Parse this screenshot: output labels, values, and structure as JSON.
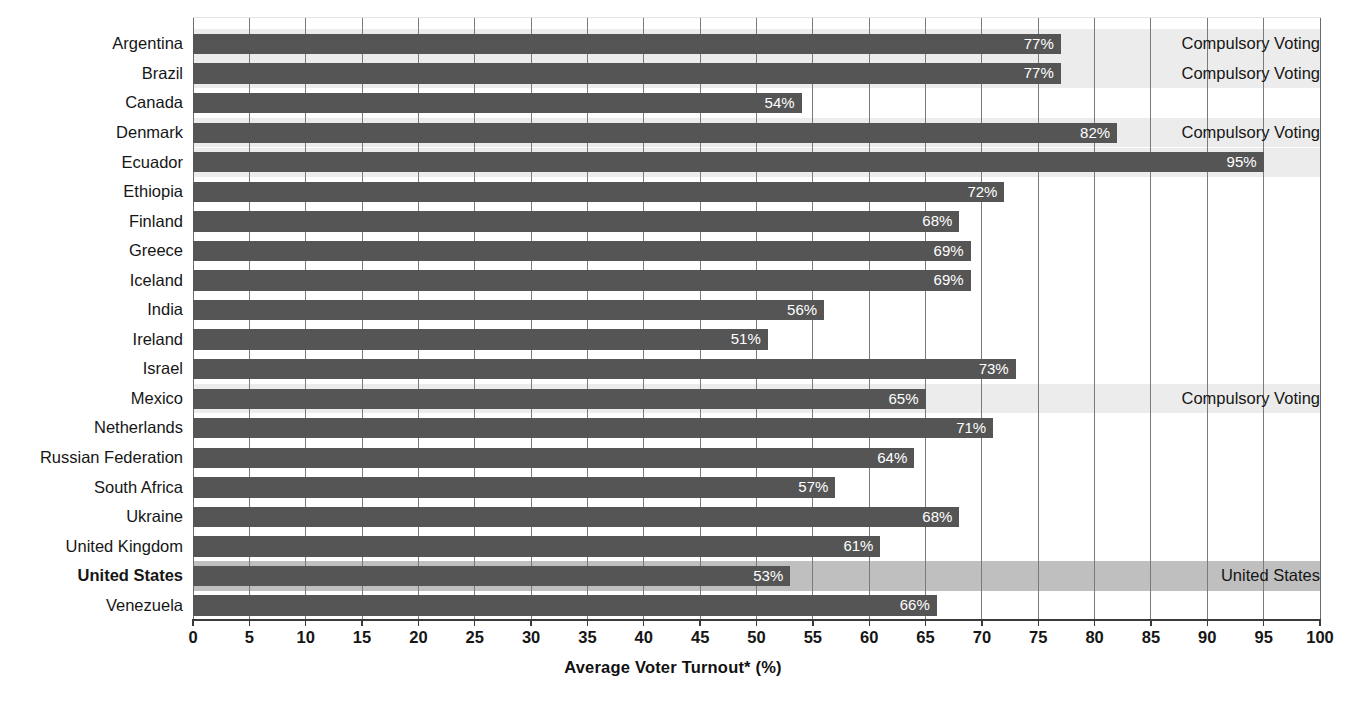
{
  "chart_data": {
    "type": "bar",
    "orientation": "horizontal",
    "title": "",
    "xlabel": "Average Voter Turnout* (%)",
    "ylabel": "",
    "xlim": [
      0,
      100
    ],
    "xticks": [
      0,
      5,
      10,
      15,
      20,
      25,
      30,
      35,
      40,
      45,
      50,
      55,
      60,
      65,
      70,
      75,
      80,
      85,
      90,
      95,
      100
    ],
    "xticklabels": [
      "0",
      "5",
      "10",
      "15",
      "20",
      "25",
      "30",
      "35",
      "40",
      "45",
      "50",
      "55",
      "60",
      "65",
      "70",
      "75",
      "80",
      "85",
      "90",
      "95",
      "100"
    ],
    "grid": true,
    "legend": false,
    "value_label_suffix": "%",
    "categories": [
      "Argentina",
      "Brazil",
      "Canada",
      "Denmark",
      "Ecuador",
      "Ethiopia",
      "Finland",
      "Greece",
      "Iceland",
      "India",
      "Ireland",
      "Israel",
      "Mexico",
      "Netherlands",
      "Russian Federation",
      "South Africa",
      "Ukraine",
      "United Kingdom",
      "United States",
      "Venezuela"
    ],
    "values": [
      77,
      77,
      54,
      82,
      95,
      72,
      68,
      69,
      69,
      56,
      51,
      73,
      65,
      71,
      64,
      57,
      68,
      61,
      53,
      66
    ],
    "value_labels": [
      "77%",
      "77%",
      "54%",
      "82%",
      "95%",
      "72%",
      "68%",
      "69%",
      "69%",
      "56%",
      "51%",
      "73%",
      "65%",
      "71%",
      "64%",
      "57%",
      "68%",
      "61%",
      "53%",
      "66%"
    ],
    "annotations": [
      {
        "category": "Argentina",
        "text": "Compulsory Voting"
      },
      {
        "category": "Brazil",
        "text": "Compulsory Voting"
      },
      {
        "category": "Denmark",
        "text": "Compulsory Voting"
      },
      {
        "category": "Mexico",
        "text": "Compulsory Voting"
      },
      {
        "category": "United States",
        "text": "United States"
      }
    ]
  },
  "rows": [
    {
      "label": "Argentina",
      "value": 77,
      "value_label": "77%",
      "note": "Compulsory Voting",
      "band": "compulsory",
      "bold": false
    },
    {
      "label": "Brazil",
      "value": 77,
      "value_label": "77%",
      "note": "Compulsory Voting",
      "band": "compulsory",
      "bold": false
    },
    {
      "label": "Canada",
      "value": 54,
      "value_label": "54%",
      "note": "",
      "band": "plain",
      "bold": false
    },
    {
      "label": "Denmark",
      "value": 82,
      "value_label": "82%",
      "note": "Compulsory Voting",
      "band": "compulsory",
      "bold": false
    },
    {
      "label": "Ecuador",
      "value": 95,
      "value_label": "95%",
      "note": "",
      "band": "compulsory",
      "bold": false
    },
    {
      "label": "Ethiopia",
      "value": 72,
      "value_label": "72%",
      "note": "",
      "band": "plain",
      "bold": false
    },
    {
      "label": "Finland",
      "value": 68,
      "value_label": "68%",
      "note": "",
      "band": "plain",
      "bold": false
    },
    {
      "label": "Greece",
      "value": 69,
      "value_label": "69%",
      "note": "",
      "band": "plain",
      "bold": false
    },
    {
      "label": "Iceland",
      "value": 69,
      "value_label": "69%",
      "note": "",
      "band": "plain",
      "bold": false
    },
    {
      "label": "India",
      "value": 56,
      "value_label": "56%",
      "note": "",
      "band": "plain",
      "bold": false
    },
    {
      "label": "Ireland",
      "value": 51,
      "value_label": "51%",
      "note": "",
      "band": "plain",
      "bold": false
    },
    {
      "label": "Israel",
      "value": 73,
      "value_label": "73%",
      "note": "",
      "band": "plain",
      "bold": false
    },
    {
      "label": "Mexico",
      "value": 65,
      "value_label": "65%",
      "note": "Compulsory Voting",
      "band": "compulsory",
      "bold": false
    },
    {
      "label": "Netherlands",
      "value": 71,
      "value_label": "71%",
      "note": "",
      "band": "plain",
      "bold": false
    },
    {
      "label": "Russian Federation",
      "value": 64,
      "value_label": "64%",
      "note": "",
      "band": "plain",
      "bold": false
    },
    {
      "label": "South Africa",
      "value": 57,
      "value_label": "57%",
      "note": "",
      "band": "plain",
      "bold": false
    },
    {
      "label": "Ukraine",
      "value": 68,
      "value_label": "68%",
      "note": "",
      "band": "plain",
      "bold": false
    },
    {
      "label": "United Kingdom",
      "value": 61,
      "value_label": "61%",
      "note": "",
      "band": "plain",
      "bold": false
    },
    {
      "label": "United States",
      "value": 53,
      "value_label": "53%",
      "note": "United States",
      "band": "us",
      "bold": true
    },
    {
      "label": "Venezuela",
      "value": 66,
      "value_label": "66%",
      "note": "",
      "band": "plain",
      "bold": false
    }
  ],
  "axis": {
    "title": "Average Voter Turnout* (%)",
    "ticks": [
      "0",
      "5",
      "10",
      "15",
      "20",
      "25",
      "30",
      "35",
      "40",
      "45",
      "50",
      "55",
      "60",
      "65",
      "70",
      "75",
      "80",
      "85",
      "90",
      "95",
      "100"
    ],
    "min": 0,
    "max": 100
  },
  "colors": {
    "bar": "#555555",
    "band_compulsory": "#ececec",
    "band_highlight": "#bfbfbf",
    "gridline": "#7a7a7a",
    "axis": "#3a3a3a",
    "text": "#161616",
    "value_text": "#ffffff"
  }
}
